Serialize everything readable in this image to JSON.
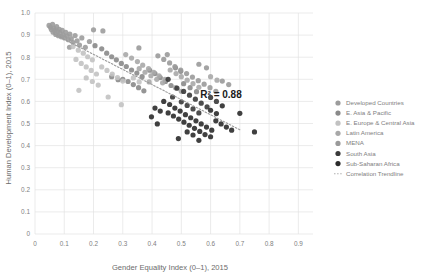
{
  "chart_data": {
    "type": "scatter",
    "title": "",
    "xlabel": "Gender Equality Index (0–1), 2015",
    "ylabel": "Human Development Index (0–1), 2015",
    "xlim": [
      0,
      0.95
    ],
    "ylim": [
      0,
      1.0
    ],
    "xticks": [
      "0",
      "0.1",
      "0.2",
      "0.3",
      "0.4",
      "0.5",
      "0.6",
      "0.7",
      "0.8",
      "0.9"
    ],
    "xtick_values": [
      0,
      0.1,
      0.2,
      0.3,
      0.4,
      0.5,
      0.6,
      0.7,
      0.8,
      0.9
    ],
    "yticks": [
      "0",
      "0.1",
      "0.2",
      "0.3",
      "0.4",
      "0.5",
      "0.6",
      "0.7",
      "0.8",
      "0.9",
      "1.0"
    ],
    "ytick_values": [
      0,
      0.1,
      0.2,
      0.3,
      0.4,
      0.5,
      0.6,
      0.7,
      0.8,
      0.9,
      1.0
    ],
    "grid": true,
    "legend_position": "right",
    "annotations": [
      {
        "text": "R² = 0.88",
        "x": 0.565,
        "y": 0.615
      }
    ],
    "trendline": {
      "label": "Correlation Trendline",
      "style": "dotted",
      "color": "#9a9a9a",
      "x0": 0.065,
      "y0": 0.905,
      "x1": 0.705,
      "y1": 0.468
    },
    "series": [
      {
        "name": "Developed Countries",
        "color": "#9c9c9c",
        "points": [
          [
            0.048,
            0.944
          ],
          [
            0.053,
            0.935
          ],
          [
            0.056,
            0.925
          ],
          [
            0.06,
            0.949
          ],
          [
            0.062,
            0.913
          ],
          [
            0.065,
            0.93
          ],
          [
            0.068,
            0.92
          ],
          [
            0.071,
            0.903
          ],
          [
            0.074,
            0.938
          ],
          [
            0.077,
            0.916
          ],
          [
            0.08,
            0.897
          ],
          [
            0.083,
            0.926
          ],
          [
            0.086,
            0.908
          ],
          [
            0.09,
            0.892
          ],
          [
            0.093,
            0.921
          ],
          [
            0.097,
            0.9
          ],
          [
            0.101,
            0.887
          ],
          [
            0.105,
            0.913
          ],
          [
            0.11,
            0.896
          ],
          [
            0.114,
            0.879
          ],
          [
            0.119,
            0.905
          ],
          [
            0.124,
            0.884
          ],
          [
            0.13,
            0.866
          ],
          [
            0.137,
            0.898
          ],
          [
            0.144,
            0.874
          ],
          [
            0.152,
            0.855
          ],
          [
            0.16,
            0.887
          ],
          [
            0.172,
            0.845
          ],
          [
            0.186,
            0.871
          ],
          [
            0.2,
            0.924
          ],
          [
            0.232,
            0.919
          ],
          [
            0.118,
            0.845
          ]
        ]
      },
      {
        "name": "E. Asia & Pacific",
        "color": "#8a8a8a",
        "points": [
          [
            0.205,
            0.852
          ],
          [
            0.228,
            0.838
          ],
          [
            0.245,
            0.818
          ],
          [
            0.262,
            0.802
          ],
          [
            0.278,
            0.788
          ],
          [
            0.295,
            0.772
          ],
          [
            0.312,
            0.758
          ],
          [
            0.33,
            0.742
          ],
          [
            0.348,
            0.728
          ],
          [
            0.366,
            0.712
          ],
          [
            0.3,
            0.7
          ],
          [
            0.318,
            0.69
          ],
          [
            0.336,
            0.676
          ],
          [
            0.354,
            0.662
          ],
          [
            0.372,
            0.648
          ],
          [
            0.392,
            0.741
          ],
          [
            0.41,
            0.726
          ],
          [
            0.428,
            0.708
          ],
          [
            0.446,
            0.69
          ],
          [
            0.465,
            0.672
          ],
          [
            0.262,
            0.712
          ],
          [
            0.284,
            0.698
          ],
          [
            0.508,
            0.68
          ],
          [
            0.53,
            0.662
          ],
          [
            0.552,
            0.644
          ],
          [
            0.48,
            0.752
          ],
          [
            0.498,
            0.736
          ]
        ]
      },
      {
        "name": "E. Europe & Central Asia",
        "color": "#c2c2c2",
        "points": [
          [
            0.13,
            0.848
          ],
          [
            0.148,
            0.832
          ],
          [
            0.165,
            0.818
          ],
          [
            0.18,
            0.802
          ],
          [
            0.196,
            0.788
          ],
          [
            0.14,
            0.79
          ],
          [
            0.158,
            0.772
          ],
          [
            0.175,
            0.756
          ],
          [
            0.192,
            0.74
          ],
          [
            0.21,
            0.724
          ],
          [
            0.228,
            0.756
          ],
          [
            0.246,
            0.74
          ],
          [
            0.264,
            0.724
          ],
          [
            0.282,
            0.708
          ],
          [
            0.3,
            0.692
          ],
          [
            0.175,
            0.706
          ],
          [
            0.196,
            0.69
          ],
          [
            0.216,
            0.674
          ],
          [
            0.336,
            0.706
          ],
          [
            0.356,
            0.688
          ],
          [
            0.15,
            0.65
          ],
          [
            0.25,
            0.62
          ],
          [
            0.295,
            0.585
          ]
        ]
      },
      {
        "name": "Latin America",
        "color": "#a8a8a8",
        "points": [
          [
            0.31,
            0.812
          ],
          [
            0.33,
            0.796
          ],
          [
            0.35,
            0.78
          ],
          [
            0.368,
            0.764
          ],
          [
            0.388,
            0.748
          ],
          [
            0.406,
            0.732
          ],
          [
            0.424,
            0.716
          ],
          [
            0.444,
            0.7
          ],
          [
            0.462,
            0.742
          ],
          [
            0.482,
            0.726
          ],
          [
            0.356,
            0.748
          ],
          [
            0.376,
            0.732
          ],
          [
            0.396,
            0.716
          ],
          [
            0.416,
            0.7
          ],
          [
            0.436,
            0.684
          ],
          [
            0.5,
            0.712
          ],
          [
            0.52,
            0.696
          ],
          [
            0.54,
            0.68
          ],
          [
            0.56,
            0.664
          ],
          [
            0.39,
            0.688
          ],
          [
            0.6,
            0.712
          ],
          [
            0.622,
            0.696
          ],
          [
            0.48,
            0.662
          ],
          [
            0.5,
            0.646
          ]
        ]
      },
      {
        "name": "MENA",
        "color": "#9a9a9a",
        "points": [
          [
            0.355,
            0.842
          ],
          [
            0.42,
            0.806
          ],
          [
            0.44,
            0.79
          ],
          [
            0.46,
            0.774
          ],
          [
            0.478,
            0.758
          ],
          [
            0.498,
            0.742
          ],
          [
            0.518,
            0.726
          ],
          [
            0.538,
            0.71
          ],
          [
            0.558,
            0.694
          ],
          [
            0.578,
            0.678
          ],
          [
            0.598,
            0.662
          ],
          [
            0.618,
            0.646
          ],
          [
            0.452,
            0.812
          ],
          [
            0.56,
            0.768
          ],
          [
            0.586,
            0.752
          ],
          [
            0.64,
            0.692
          ],
          [
            0.662,
            0.676
          ]
        ]
      },
      {
        "name": "South Asia",
        "color": "#3a3a3a",
        "points": [
          [
            0.455,
            0.7
          ],
          [
            0.485,
            0.66
          ],
          [
            0.508,
            0.645
          ],
          [
            0.528,
            0.628
          ],
          [
            0.548,
            0.61
          ],
          [
            0.568,
            0.592
          ],
          [
            0.588,
            0.575
          ],
          [
            0.5,
            0.598
          ],
          [
            0.52,
            0.582
          ],
          [
            0.54,
            0.566
          ],
          [
            0.47,
            0.62
          ],
          [
            0.56,
            0.548
          ],
          [
            0.6,
            0.618
          ],
          [
            0.62,
            0.6
          ]
        ]
      },
      {
        "name": "Sub-Saharan Africa",
        "color": "#2b2b2b",
        "points": [
          [
            0.44,
            0.6
          ],
          [
            0.46,
            0.586
          ],
          [
            0.478,
            0.57
          ],
          [
            0.496,
            0.556
          ],
          [
            0.514,
            0.54
          ],
          [
            0.532,
            0.526
          ],
          [
            0.55,
            0.512
          ],
          [
            0.568,
            0.498
          ],
          [
            0.586,
            0.484
          ],
          [
            0.604,
            0.47
          ],
          [
            0.455,
            0.548
          ],
          [
            0.473,
            0.534
          ],
          [
            0.491,
            0.52
          ],
          [
            0.509,
            0.506
          ],
          [
            0.527,
            0.492
          ],
          [
            0.545,
            0.478
          ],
          [
            0.563,
            0.464
          ],
          [
            0.581,
            0.45
          ],
          [
            0.6,
            0.44
          ],
          [
            0.618,
            0.512
          ],
          [
            0.636,
            0.498
          ],
          [
            0.654,
            0.484
          ],
          [
            0.672,
            0.47
          ],
          [
            0.52,
            0.462
          ],
          [
            0.54,
            0.448
          ],
          [
            0.41,
            0.57
          ],
          [
            0.428,
            0.556
          ],
          [
            0.49,
            0.432
          ],
          [
            0.56,
            0.424
          ],
          [
            0.7,
            0.546
          ],
          [
            0.75,
            0.462
          ],
          [
            0.64,
            0.58
          ],
          [
            0.418,
            0.498
          ],
          [
            0.398,
            0.53
          ],
          [
            0.6,
            0.56
          ],
          [
            0.62,
            0.545
          ]
        ]
      }
    ]
  },
  "legend": {
    "items": [
      {
        "label": "Developed Countries",
        "color": "#9c9c9c"
      },
      {
        "label": "E. Asia & Pacific",
        "color": "#8a8a8a"
      },
      {
        "label": "E. Europe & Central Asia",
        "color": "#c2c2c2"
      },
      {
        "label": "Latin America",
        "color": "#a8a8a8"
      },
      {
        "label": "MENA",
        "color": "#9a9a9a"
      },
      {
        "label": "South Asia",
        "color": "#3a3a3a"
      },
      {
        "label": "Sub-Saharan Africa",
        "color": "#2b2b2b"
      }
    ],
    "trendline_label": "Correlation Trendline"
  }
}
